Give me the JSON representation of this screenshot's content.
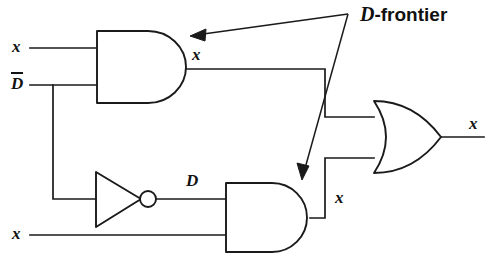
{
  "figure": {
    "kind": "logic-circuit-diagram",
    "width": 495,
    "height": 269,
    "background_color": "#ffffff",
    "ink_color": "#1a1a1a"
  },
  "labels": {
    "input_x_top": "x",
    "input_dbar": "D",
    "input_dbar_overbar": true,
    "input_x_bottom": "x",
    "and_top_output": "x",
    "inverter_output": "D",
    "and_bottom_output": "x",
    "or_output": "x"
  },
  "annotation": {
    "italic_part": "D",
    "rest": "-frontier",
    "full_text": "D-frontier",
    "arrow_count": 2,
    "arrow_targets": [
      "and-gate-top-output",
      "and-gate-bottom-output"
    ]
  },
  "gates": [
    {
      "id": "and-gate-top",
      "type": "AND",
      "inputs": [
        "x",
        "D-bar"
      ],
      "output_label": "x",
      "on_d_frontier": true
    },
    {
      "id": "inverter",
      "type": "NOT",
      "inputs": [
        "D-bar"
      ],
      "output_label": "D",
      "on_d_frontier": false
    },
    {
      "id": "and-gate-bottom",
      "type": "AND",
      "inputs": [
        "D",
        "x"
      ],
      "output_label": "x",
      "on_d_frontier": true
    },
    {
      "id": "or-gate",
      "type": "OR",
      "inputs": [
        "and-gate-top-output",
        "and-gate-bottom-output"
      ],
      "output_label": "x",
      "on_d_frontier": false
    }
  ]
}
